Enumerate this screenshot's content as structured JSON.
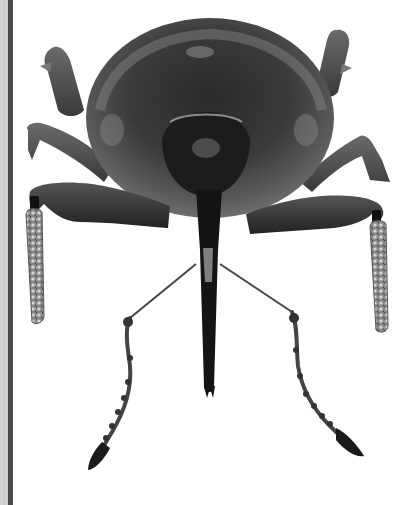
{
  "image": {
    "subject": "weevil",
    "view": "frontal, grayscale specimen photograph",
    "background": "#ffffff",
    "colors": {
      "body_dark": "#1e1e1e",
      "body_mid": "#4a4a4a",
      "body_light": "#8a8a8a",
      "edge_strip": "#d0d0d0",
      "edge_bar": "#4a4a4a"
    }
  }
}
